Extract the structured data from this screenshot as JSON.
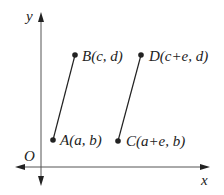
{
  "diagram": {
    "axes": {
      "x_label": "x",
      "y_label": "y",
      "origin_label": "O"
    },
    "points": [
      {
        "id": "A",
        "label": "A(a, b)"
      },
      {
        "id": "B",
        "label": "B(c, d)"
      },
      {
        "id": "C",
        "label": "C(a+e, b)"
      },
      {
        "id": "D",
        "label": "D(c+e, d)"
      }
    ],
    "segments": [
      [
        "A",
        "B"
      ],
      [
        "C",
        "D"
      ]
    ]
  }
}
